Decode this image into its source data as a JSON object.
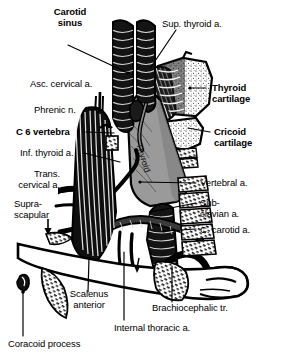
{
  "figure": {
    "kind": "anatomical-illustration",
    "region": "root of the neck, anterior view",
    "palette": {
      "ink": "#000000",
      "paper": "#ffffff",
      "gland_gray": "#9a9a9a",
      "gland_gray_dark": "#6e6e6e",
      "cartilage_stipple": "#f2f2f2",
      "vessel_dark": "#151515"
    }
  },
  "labels": {
    "carotid_sinus": "Carotid\nsinus",
    "sup_thyroid": "Sup. thyroid a.",
    "asc_cervical": "Asc. cervical a.",
    "thyroid_cartilage": "Thyroid\ncartilage",
    "phrenic": "Phrenic n.",
    "c6_vertebra": "C 6 vertebra",
    "cricoid_cartilage": "Cricoid\ncartilage",
    "inf_thyroid": "Inf. thyroid a.",
    "trans_cervical": "Trans.\ncervical a.",
    "thyroid_gland": "Thyroid",
    "vertebral": "Vertebral a.",
    "suprascapular": "Supra-\nscapular",
    "subclavian": "Sub-\nclavian a.",
    "c_carotid": "C. carotid a.",
    "scalenus_anterior": "Scalenus\nanterior",
    "brachiocephalic": "Brachiocephalic tr.",
    "internal_thoracic": "Internal thoracic a.",
    "coracoid_process": "Coracoid process"
  }
}
